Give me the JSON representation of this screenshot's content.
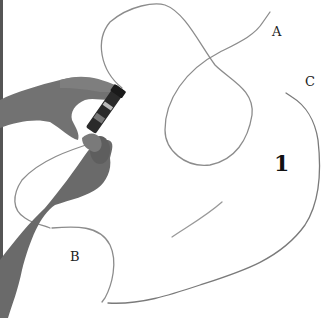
{
  "figure": {
    "labels": {
      "a": "A",
      "b": "B",
      "c": "C"
    },
    "step_number": "1"
  },
  "colors": {
    "background": "#ffffff",
    "wire": "#8a8a8a",
    "skin": "#6e6e6e",
    "tool": "#2a2a2a",
    "text": "#222222"
  }
}
